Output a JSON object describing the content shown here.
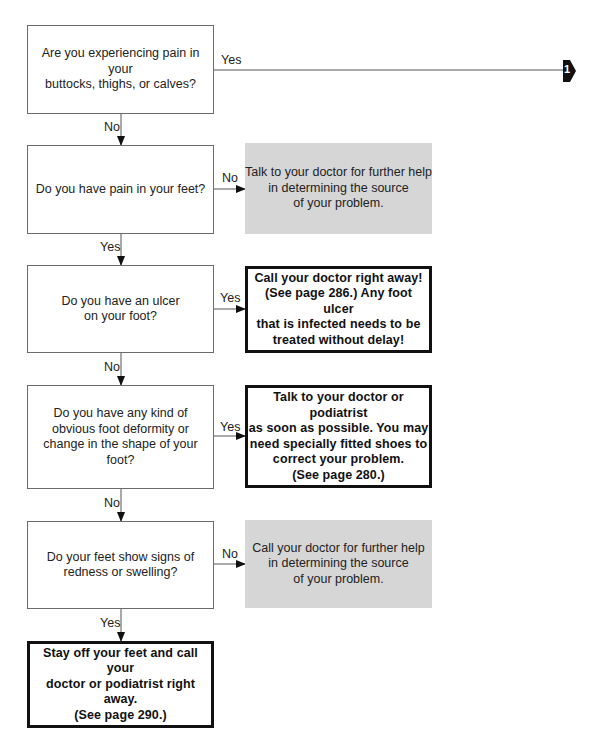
{
  "questions": [
    {
      "text": "Are you experiencing pain in your\nbuttocks, thighs, or calves?"
    },
    {
      "text": "Do you have pain in your feet?"
    },
    {
      "text": "Do you have an ulcer\non your foot?"
    },
    {
      "text": "Do you have any kind of\nobvious foot deformity or\nchange in the shape of your foot?"
    },
    {
      "text": "Do your feet show signs of\nredness or swelling?"
    }
  ],
  "outcomes": [
    {
      "style": "gray",
      "text": "Talk to your doctor for further help\nin determining the source\nof your problem."
    },
    {
      "style": "bold",
      "text": "Call your doctor right away!\n(See page 286.) Any foot ulcer\nthat is infected needs to be\ntreated without delay!"
    },
    {
      "style": "bold",
      "text": "Talk to your doctor or podiatrist\nas soon as possible. You may\nneed specially fitted shoes to\ncorrect your problem.\n(See page 280.)"
    },
    {
      "style": "gray",
      "text": "Call your doctor for further help\nin determining the source\nof your problem."
    },
    {
      "style": "bold",
      "text": "Stay off your feet and call your\ndoctor or podiatrist right away.\n(See page 290.)"
    }
  ],
  "connectors": {
    "q1_right": "Yes",
    "q1_down": "No",
    "q2_right": "No",
    "q2_down": "Yes",
    "q3_right": "Yes",
    "q3_down": "No",
    "q4_right": "Yes",
    "q4_down": "No",
    "q5_right": "No",
    "q5_down": "Yes"
  },
  "continuation_marker": {
    "label": "1",
    "icon": "arrow-pointer-icon"
  }
}
